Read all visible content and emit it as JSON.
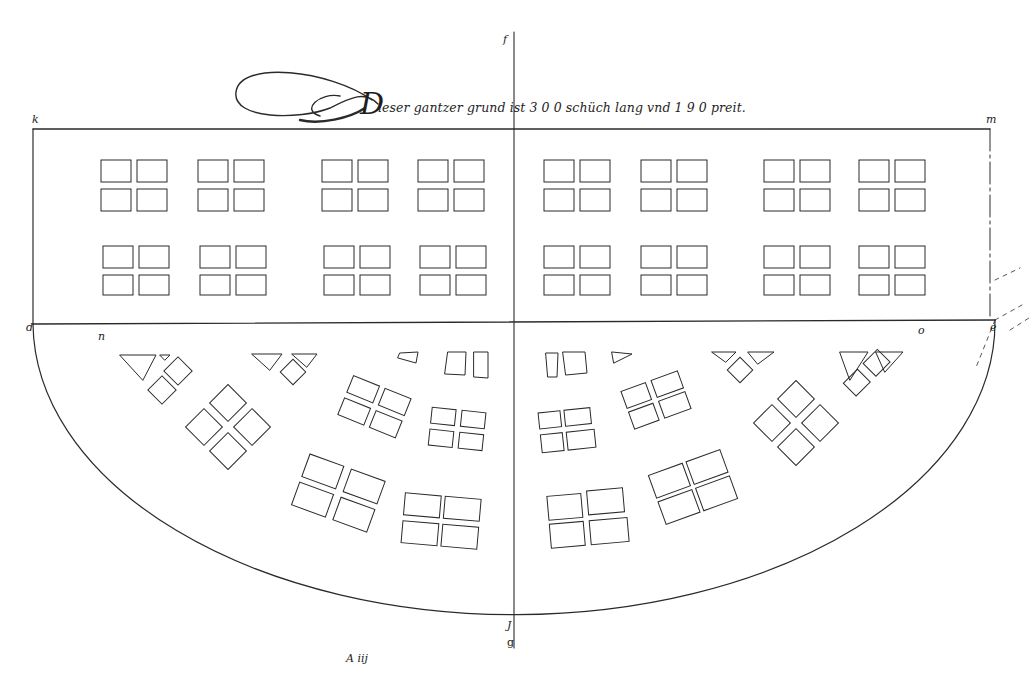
{
  "document": {
    "type": "architectural ground plan",
    "title_caption": "Dieser gantzer grund ist 3 0 0 schüch lang vnd 1 9 0 preit.",
    "title_initial": "D",
    "title_rest": "ieser gantzer grund ist 3 0 0 schüch lang vnd 1 9 0 preit.",
    "folio_mark": "A iij",
    "ink_color": "#2a2a2a",
    "paper_color": "#ffffff"
  },
  "labels": {
    "top_axis": "f",
    "top_left_corner": "k",
    "top_right_corner": "m",
    "left_mid": "d",
    "left_inner": "n",
    "right_inner": "o",
    "right_mid": "e",
    "bottom_axis_upper": "J",
    "bottom_axis_lower": "g"
  },
  "dimensions": {
    "length": "3 0 0",
    "length_unit": "schüch",
    "width": "1 9 0"
  },
  "rectangle_section": {
    "description": "rectangular upper block with 4 rows x 8 groups of paired window frames",
    "rows": 2,
    "groups_per_row": 8,
    "panes_per_group": 4
  },
  "semicircle_section": {
    "description": "half-round lower block with radial window groups",
    "rings": 3
  }
}
